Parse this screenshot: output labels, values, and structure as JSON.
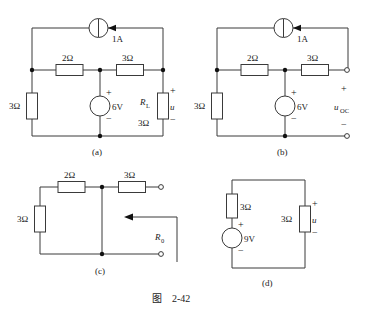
{
  "figure": {
    "caption_prefix": "图",
    "caption_number": "2-42",
    "caption_full": "图  2-42"
  },
  "panels": [
    {
      "id": "a",
      "caption": "(a)",
      "components": {
        "current_source": {
          "label": "1A",
          "symbol": "current-source-circle",
          "arrow_direction": "left"
        },
        "resistor_top_left": {
          "label": "2Ω"
        },
        "resistor_top_right": {
          "label": "3Ω"
        },
        "resistor_left": {
          "label": "3Ω"
        },
        "voltage_source": {
          "label": "6V",
          "plus": "+",
          "minus": "−"
        },
        "load_resistor": {
          "name": "R",
          "subscript": "L",
          "value": "3Ω"
        },
        "output_voltage": {
          "name": "u",
          "plus": "+",
          "minus": "−"
        }
      }
    },
    {
      "id": "b",
      "caption": "(b)",
      "components": {
        "current_source": {
          "label": "1A",
          "symbol": "current-source-circle",
          "arrow_direction": "left"
        },
        "resistor_top_left": {
          "label": "2Ω"
        },
        "resistor_top_right": {
          "label": "3Ω"
        },
        "resistor_left": {
          "label": "3Ω"
        },
        "voltage_source": {
          "label": "6V",
          "plus": "+",
          "minus": "−"
        },
        "open_circuit_voltage": {
          "name": "u",
          "subscript": "OC",
          "plus": "+",
          "minus": "−"
        }
      }
    },
    {
      "id": "c",
      "caption": "(c)",
      "components": {
        "resistor_top_left": {
          "label": "2Ω"
        },
        "resistor_top_right": {
          "label": "3Ω"
        },
        "resistor_left": {
          "label": "3Ω"
        },
        "equivalent_resistance": {
          "name": "R",
          "subscript": "0",
          "arrow_direction": "left"
        }
      }
    },
    {
      "id": "d",
      "caption": "(d)",
      "components": {
        "resistor_left": {
          "label": "3Ω"
        },
        "voltage_source": {
          "label": "9V",
          "plus": "+",
          "minus": "−"
        },
        "resistor_right": {
          "label": "3Ω"
        },
        "output_voltage": {
          "name": "u",
          "plus": "+",
          "minus": "−"
        }
      }
    }
  ],
  "colors": {
    "wire": "#3a3a3a",
    "node": "#111111",
    "background": "#ffffff",
    "text": "#1a1a1a"
  }
}
